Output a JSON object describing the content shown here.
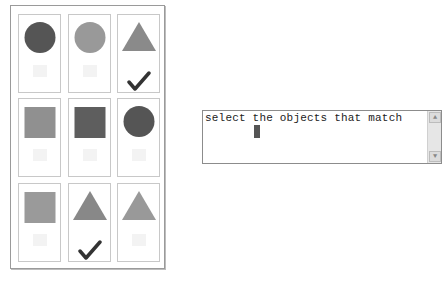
{
  "grid": {
    "cells": [
      {
        "shape": "circle",
        "color": "#555555",
        "checked": false
      },
      {
        "shape": "circle",
        "color": "#999999",
        "checked": false
      },
      {
        "shape": "triangle",
        "color": "#8a8a8a",
        "checked": true
      },
      {
        "shape": "square",
        "color": "#909090",
        "checked": false
      },
      {
        "shape": "square",
        "color": "#5e5e5e",
        "checked": false
      },
      {
        "shape": "circle",
        "color": "#555555",
        "checked": false
      },
      {
        "shape": "square",
        "color": "#9a9a9a",
        "checked": false
      },
      {
        "shape": "triangle",
        "color": "#888888",
        "checked": true
      },
      {
        "shape": "triangle",
        "color": "#999999",
        "checked": false
      }
    ]
  },
  "instruction": {
    "text": "select the objects that match",
    "scroll_up_icon": "▲",
    "scroll_down_icon": "▼"
  },
  "colors": {
    "check": "#333333"
  }
}
